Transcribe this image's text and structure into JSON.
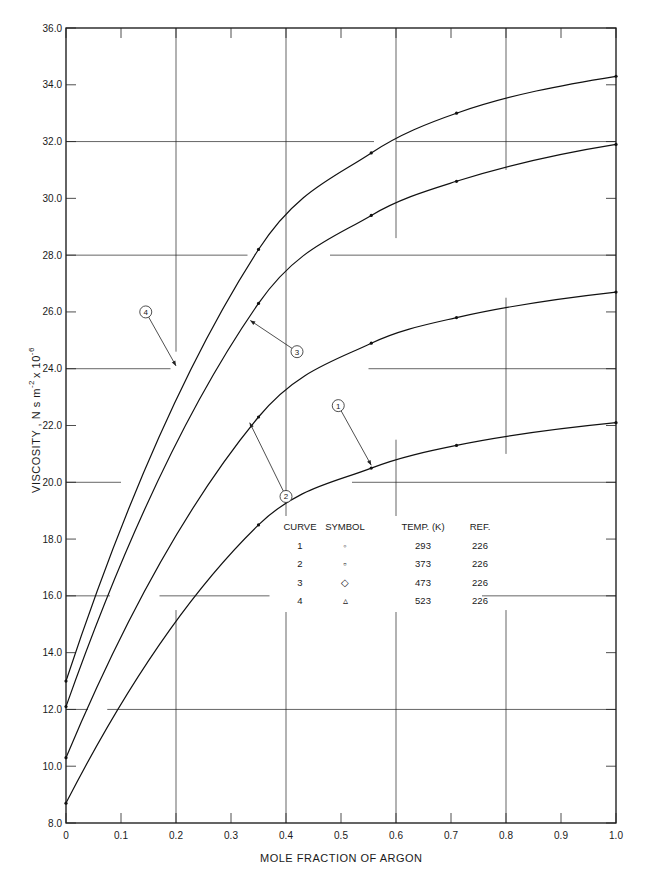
{
  "chart_data": {
    "type": "line",
    "title": "",
    "xlabel": "MOLE FRACTION OF ARGON",
    "ylabel": "VISCOSITY , N s m⁻² x 10⁻⁶",
    "ylabel_main": "VISCOSITY , N s m",
    "ylabel_exp1": "-2",
    "ylabel_mid": "x 10",
    "ylabel_exp2": "-6",
    "xlim": [
      0,
      1.0
    ],
    "ylim": [
      8.0,
      36.0
    ],
    "x_ticks": [
      "0",
      "0.1",
      "0.2",
      "0.3",
      "0.4",
      "0.5",
      "0.6",
      "0.7",
      "0.8",
      "0.9",
      "1.0"
    ],
    "y_ticks": [
      "8.0",
      "10.0",
      "12.0",
      "14.0",
      "16.0",
      "18.0",
      "20.0",
      "22.0",
      "24.0",
      "26.0",
      "28.0",
      "30.0",
      "32.0",
      "34.0",
      "36.0"
    ],
    "grid": "partial",
    "series": [
      {
        "name": "1",
        "temp_K": 293,
        "symbol": "circle",
        "x": [
          0,
          0.35,
          0.555,
          0.71,
          1.0
        ],
        "values": [
          8.7,
          18.5,
          20.5,
          21.3,
          22.1
        ]
      },
      {
        "name": "2",
        "temp_K": 373,
        "symbol": "square",
        "x": [
          0,
          0.35,
          0.555,
          0.71,
          1.0
        ],
        "values": [
          10.3,
          22.3,
          24.9,
          25.8,
          26.7
        ]
      },
      {
        "name": "3",
        "temp_K": 473,
        "symbol": "diamond",
        "x": [
          0,
          0.35,
          0.555,
          0.71,
          1.0
        ],
        "values": [
          12.1,
          26.3,
          29.4,
          30.6,
          31.9
        ]
      },
      {
        "name": "4",
        "temp_K": 523,
        "symbol": "triangle",
        "x": [
          0,
          0.35,
          0.555,
          0.71,
          1.0
        ],
        "values": [
          13.0,
          28.2,
          31.6,
          33.0,
          34.3
        ]
      }
    ],
    "callouts": [
      {
        "label": "1",
        "cx": 0.495,
        "cy": 22.7,
        "tx": 0.555,
        "ty": 20.6
      },
      {
        "label": "2",
        "cx": 0.4,
        "cy": 19.5,
        "tx": 0.334,
        "ty": 22.1
      },
      {
        "label": "3",
        "cx": 0.42,
        "cy": 24.6,
        "tx": 0.335,
        "ty": 25.7
      },
      {
        "label": "4",
        "cx": 0.145,
        "cy": 26.0,
        "tx": 0.2,
        "ty": 24.1
      }
    ],
    "legend": {
      "headers": [
        "CURVE",
        "SYMBOL",
        "TEMP. (K)",
        "REF."
      ],
      "rows": [
        [
          "1",
          "◦",
          "293",
          "226"
        ],
        [
          "2",
          "▫",
          "373",
          "226"
        ],
        [
          "3",
          "◇",
          "473",
          "226"
        ],
        [
          "4",
          "▵",
          "523",
          "226"
        ]
      ],
      "position": "center-right inside plot"
    }
  }
}
